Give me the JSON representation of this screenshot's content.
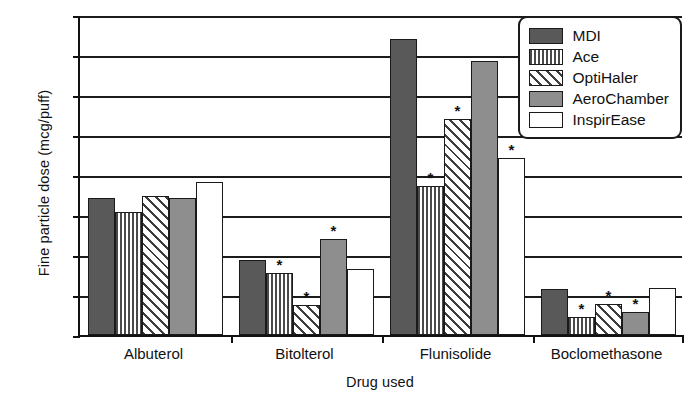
{
  "chart_data": {
    "type": "bar",
    "title": "",
    "xlabel": "Drug used",
    "ylabel": "Fine particle dose (mcg/puff)",
    "categories": [
      "Albuterol",
      "Bitolterol",
      "Flunisolide",
      "Boclomethasone"
    ],
    "ylim": [
      0,
      80
    ],
    "yticks": [
      0,
      10,
      20,
      30,
      40,
      50,
      60,
      70,
      80
    ],
    "grid": true,
    "legend_position": "top-right",
    "series": [
      {
        "name": "MDI",
        "fill": "solid-dark-gray",
        "color": "#595959",
        "values": [
          34.2,
          18.8,
          74.0,
          11.5
        ],
        "significance": [
          false,
          false,
          false,
          false
        ]
      },
      {
        "name": "Ace",
        "fill": "vertical-hatch",
        "color": "#4a4a4a",
        "values": [
          30.7,
          15.6,
          37.3,
          4.5
        ],
        "significance": [
          false,
          true,
          true,
          true
        ]
      },
      {
        "name": "OptiHaler",
        "fill": "diagonal-hatch",
        "color": "#3d3d3d",
        "values": [
          34.8,
          7.5,
          54.0,
          7.8
        ],
        "significance": [
          false,
          true,
          true,
          true
        ]
      },
      {
        "name": "AeroChamber",
        "fill": "solid-medium-gray",
        "color": "#8e8e8e",
        "values": [
          34.2,
          24.0,
          68.5,
          5.8
        ],
        "significance": [
          false,
          true,
          false,
          true
        ]
      },
      {
        "name": "InspirEase",
        "fill": "white",
        "color": "#ffffff",
        "values": [
          38.2,
          16.5,
          44.3,
          11.7
        ],
        "significance": [
          false,
          false,
          true,
          false
        ]
      }
    ],
    "annotation_symbol": "*"
  },
  "axis": {
    "y_tick_labels": [
      "80",
      "70",
      "60",
      "50",
      "40",
      "30",
      "20",
      "10",
      "0"
    ]
  }
}
